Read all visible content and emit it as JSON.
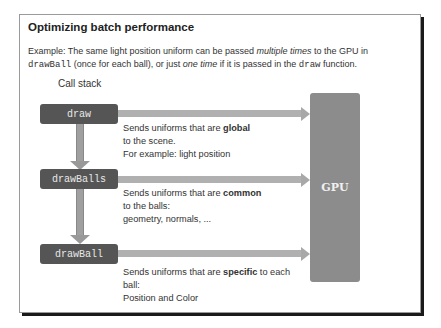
{
  "slide": {
    "title": "Optimizing batch performance",
    "description": {
      "part1": "Example: The same light position uniform can be passed ",
      "em1": "multiple times",
      "part2": " to the GPU in ",
      "code1": "drawBall",
      "part3": " (once for each ball), or just ",
      "em2": "one time",
      "part4": " if it is passed in the ",
      "code2": "draw",
      "part5": " function."
    }
  },
  "diagram": {
    "call_stack_label": "Call stack",
    "functions": [
      {
        "name": "draw"
      },
      {
        "name": "drawBalls"
      },
      {
        "name": "drawBall"
      }
    ],
    "target_label": "GPU",
    "notes": [
      {
        "pre": "Sends uniforms  that are ",
        "bold": "global",
        "post": "",
        "line2": "to the scene.",
        "line3": "For example: light position"
      },
      {
        "pre": "Sends uniforms  that are ",
        "bold": "common",
        "post": "",
        "line2": "to the balls:",
        "line3": "geometry, normals, ..."
      },
      {
        "pre": "Sends uniforms  that are ",
        "bold": "specific",
        "post": " to each",
        "line2": "ball:",
        "line3": "Position and Color"
      }
    ]
  },
  "colors": {
    "function_box": "#555555",
    "gpu_box": "#8c8c8c",
    "arrow": "#a8a8a8"
  }
}
